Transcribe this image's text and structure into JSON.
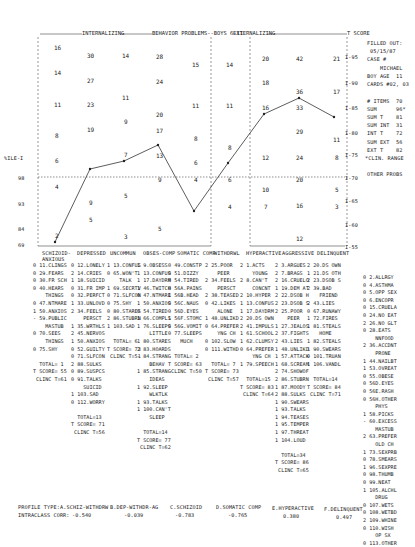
{
  "header": {
    "internalizing": "INTERNALIZING",
    "behavior_title": "BEHAVIOR PROBLEMS--BOYS 6-11",
    "externalizing": "EXTERNALIZING",
    "t_score": "T SCORE"
  },
  "side_info": {
    "filled_out_label": "FILLED OUT:",
    "filled_out_date": "05/15/87",
    "case_label": "CASE #",
    "case_name": "MICHAEL",
    "boy_age": "BOY AGE  11",
    "cards": "CARDS #02, 03",
    "items": "# ITEMS  70",
    "sum": "SUM      96*",
    "sum_t": "SUM T    81",
    "sum_int": "SUM INT  31",
    "int_t": "INT T    72",
    "sum_ext": "SUM EXT  56",
    "ext_t": "EXT T    82",
    "clin_range": "*CLIN. RANGE",
    "other_probs_title": "OTHER PROBS"
  },
  "y_axis": {
    "tscore_ticks": [
      "I-95",
      "I-90",
      "I-85",
      "I-80",
      "I-75",
      "I-70",
      "I-65",
      "I-60",
      "I-55"
    ],
    "percentile_labels": [
      "%ILE-I",
      "98",
      "93",
      "84",
      "69"
    ]
  },
  "chart_data": {
    "type": "line",
    "title": "BEHAVIOR PROBLEMS--BOYS 6-11",
    "groups": [
      {
        "name": "INTERNALIZING",
        "scales": [
          "SCHIZOID-ANXIOUS",
          "DEPRESSED",
          "UNCOMMUN",
          "OBSES-COMP",
          "SOMATIC COMP",
          "WITHDRWL"
        ]
      },
      {
        "name": "EXTERNALIZING",
        "scales": [
          "HYPERACTIVE",
          "AGGRESSIVE",
          "DELINQUENT"
        ]
      }
    ],
    "categories": [
      "SCHIZOID-ANXIOUS",
      "DEPRESSED",
      "UNCOMMUN",
      "OBSES-COMP",
      "SOMATIC COMP",
      "WITHDRWL",
      "HYPERACTIVE",
      "AGGRESSIVE",
      "DELINQUENT"
    ],
    "series": [
      {
        "name": "T SCORE",
        "values": [
          55,
          71,
          73,
          77,
          63,
          73,
          83,
          86,
          84
        ]
      },
      {
        "name": "Raw total",
        "values": [
          1,
          13,
          6,
          14,
          2,
          7,
          15,
          34,
          14
        ]
      }
    ],
    "clinical_cutoff_t": 70,
    "ylabel": "T SCORE",
    "ylim": [
      55,
      100
    ],
    "scale_ticks": [
      [
        "16",
        "14",
        "11",
        "8",
        "6",
        "4",
        "2"
      ],
      [
        "30",
        "27",
        "23",
        "19",
        "",
        "9",
        "5"
      ],
      [
        "14",
        "11",
        "9",
        "7",
        "5",
        "3"
      ],
      [
        "28",
        "24",
        "20",
        "17",
        "13",
        "9",
        "5"
      ],
      [
        "15",
        "11",
        "8",
        "6",
        "4"
      ],
      [
        "14",
        "11",
        "8",
        "6",
        "4"
      ],
      [
        "20",
        "18",
        "16",
        "12",
        "10",
        "7"
      ],
      [
        "42",
        "36",
        "33",
        "29",
        "24",
        "20",
        "16",
        "12"
      ],
      [
        "21",
        "17",
        "11",
        "8",
        "5",
        "3"
      ]
    ],
    "profile_types": [
      {
        "name": "A.SCHIZ-WITHDRW",
        "corr": "-0.540"
      },
      {
        "name": "B.DEP-WITHDR-AG",
        "corr": "-0.039"
      },
      {
        "name": "C.SCHIZOID",
        "corr": "-0.783"
      },
      {
        "name": "D.SOMATIC COMP",
        "corr": "-0.765"
      },
      {
        "name": "E.HYPERACTIVE",
        "corr": "0.380"
      },
      {
        "name": "F.DELINQUENT",
        "corr": "0.497"
      }
    ]
  },
  "columns": [
    {
      "label": "SCHIZOID-\nANXIOUS",
      "items": [
        "0 11.CLINGS",
        "0 29.FEARS",
        "0 30.FR SCH",
        "0 40.HEARS",
        "    THINGS",
        "0 47.NTMARE",
        "1 50.ANXIOS",
        "- 59.PUBLIC",
        "    MASTUB",
        "0 70.SEES",
        "    THINGS",
        "0 75.SHY"
      ],
      "total": "TOTAL= 1",
      "tscore": "T SCORE= 55",
      "clinc": "CLINC T=61"
    },
    {
      "label": "DEPRESSED",
      "items": [
        "0 12.LONELY",
        "2 14.CRIES",
        "1 18.SUICID",
        "0 31.FR IMP",
        "0 32.PERFCT",
        "1 33.UNLOVD",
        "2 34.FEELS",
        "    PERSCT",
        "1 35.WRTHLS",
        "2 45.NERVOS",
        "1 50.ANXIOS",
        "0 52.GUILTY",
        "0 71.SLFCON",
        "2 88.SULKS",
        "0 89.SUSPCS",
        "0 91.TALKS",
        "    SUICID",
        "1 103.SAD",
        "0 112.WORRY"
      ],
      "total": "TOTAL=13",
      "tscore": "T SCORE= 71",
      "clinc": "CLINC T=56"
    },
    {
      "label": "UNCOMMUN",
      "items": [
        "1 13.CONFUS",
        "0 65.WON'T",
        "    TALK",
        "1 69.SECRTV",
        "0 71.SLFCON",
        "0 75.SHY",
        "0 80.STARES",
        "2 86.STUBRN",
        "1 103.SAD"
      ],
      "total": "TOTAL= 6",
      "tscore": "T SCORE= 73",
      "clinc": "CLINC T=51"
    },
    {
      "label": "OBSES-COMP",
      "items": [
        "1 9.OBSESS",
        "1 13.CONFUS",
        "1 17.DAYDRM",
        "1 46.TWITCH",
        "0 47.NTMARE",
        "1 50.ANXIOS",
        "0 54.TIRED",
        "1 66.COMPLS",
        "1 76.SLEEPS",
        "    LITTLE",
        "1 80.STARES",
        "2 83.HOARDS",
        "- 84.STRANG",
        "    BEHAV",
        "1 85.STRANG",
        "    IDEAS",
        "1 92.SLEEP",
        "    WLKTLK",
        "1 93.TALKS",
        "1 100.CAN'T",
        "    SLEEP"
      ],
      "total": "TOTAL=14",
      "tscore": "T SCORE= 77",
      "clinc": "CLINC T=62"
    },
    {
      "label": "SOMATIC COMP",
      "items": [
        "0 49.CONSTP",
        "0 51.DIZZY",
        "0 54.TIRED",
        "0 56A.PAINS",
        "1 56B.HEAD",
        "0 56C.NAUS",
        "0 56D.EYES",
        "1 56F.STOMC",
        "0 56G.VOMIT",
        "0 77.SLEEPS",
        "    MUCH"
      ],
      "total": "TOTAL= 2",
      "tscore": "T SCORE= 63",
      "clinc": "CLINC T=50"
    },
    {
      "label": "WITHDRWL",
      "items": [
        "2 25.POOR",
        "    PEER",
        "2 34.FEELS",
        "    PERSCT",
        "2 38.TEASED",
        "0 42.LIKES",
        "    ALONE",
        "1 48.UNLIKD",
        "0 64.PREFER",
        "    YNG CH",
        "0 102.SLOW",
        "0 111.WITHD"
      ],
      "total": "TOTAL= 7",
      "tscore": "T SCORE= 73",
      "clinc": "CLINC T=57"
    },
    {
      "label": "HYPERACTIVE",
      "items": [
        "2 1.ACTS",
        "    YOUNG",
        "2 8.CAN'T",
        "    CONCNT",
        "2 10.HYPER",
        "1 13.CONFUS",
        "1 17.DAYDRM",
        "2 20.DS OWN",
        "2 41.IMPULS",
        "1 61.SCHOOL",
        "1 62.CLUMSY",
        "0 64.PREFER",
        "    YNG CH",
        "1 79.SPEECH"
      ],
      "total": "TOTAL=15",
      "tscore": "T SCORE= 83",
      "clinc": "CLINC T=64"
    },
    {
      "label": "AGGRESSIVE",
      "items": [
        "2 3.ARGUES",
        "2 7.BRAGS",
        "2 16.CRUELO",
        "1 19.DEM AT",
        "2 22.DSOB H",
        "2 23.DSOB S",
        "2 25.POOR",
        "    PEER",
        "1 27.JEALOS",
        "2 37.FIGHTS",
        "2 43.LIES",
        "1 48.UNLIKD",
        "1 57.ATTACK",
        "1 68.SCREAM",
        "2 74.SHOWOF",
        "2 86.STUBRN",
        "1 87.MOODY",
        "2 88.SULKS",
        "1 90.SWEARS",
        "1 93.TALKS",
        "1 94.TEASES",
        "1 95.TEMPER",
        "1 97.THREAT",
        "1 104.LOUD"
      ],
      "total": "TOTAL=34",
      "tscore": "T SCORE= 86",
      "clinc": "CLINC T=65"
    },
    {
      "label": "DELINQUENT",
      "items": [
        "2 20.DS OWN",
        "1 21.DS OTH",
        "2 23.DSOB S",
        "2 39.BAD",
        "    FRIEND",
        "2 43.LIES",
        "0 67.RUNAWY",
        "1 72.FIRES",
        "1 81.STEALS",
        "    HOME",
        "1 82.STEALS",
        "1 90.SWEARS",
        "0 101.TRUAN",
        "1 106.VANDL"
      ],
      "total": "TOTAL=14",
      "tscore": "T SCORE= 84",
      "clinc": "CLINC T=71"
    },
    {
      "label": "OTHER PROBS",
      "items": [
        "0 2.ALLRGY",
        "0 4.ASTHMA",
        "0 5.OPP SEX",
        "0 6.ENCOPR",
        "0 15.CRUELA",
        "0 24.NO EAT",
        "2 26.NO GLT",
        "0 28.EATS",
        "    NNFOOD",
        "2 36.ACCDNT",
        "    PRONE",
        "1 44.NAILBT",
        "1 53.OVREAT",
        "0 55.OBESE",
        "0 56D.EYES",
        "0 56E.RASH",
        "0 56H.OTHER",
        "    PHYS",
        "1 58.PICKS",
        "- 60.EXCESS",
        "    MASTUB",
        "2 63.PREFER",
        "    OLD CH",
        "1 73.SEXPRB",
        "0 78.SMEARS",
        "1 96.SEXPRE",
        "0 98.THUMB",
        "0 99.NEAT",
        "1 105.ALCHL",
        "    DRUG",
        "0 107.WETS",
        "0 108.WETBD",
        "2 109.WHINE",
        "0 110.WISH",
        "    OP SX",
        "0 113.OTHER"
      ]
    }
  ],
  "footer": {
    "profile_type_label": "PROFILE TYPE:",
    "intraclass_label": "INTRACLASS CORR:"
  }
}
